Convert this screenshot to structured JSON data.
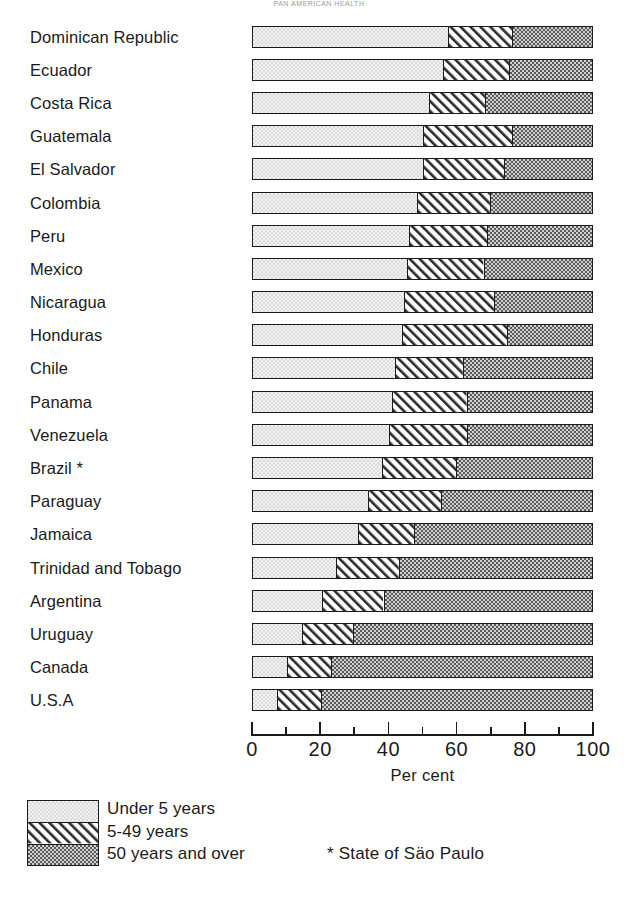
{
  "title_faint": "PAN AMERICAN HEALTH",
  "axis": {
    "label": "Per cent",
    "min": 0,
    "max": 100,
    "major_ticks": [
      0,
      20,
      40,
      60,
      80,
      100
    ],
    "minor_ticks": [
      10,
      30,
      50,
      70,
      90
    ],
    "tick_labels": [
      "0",
      "20",
      "40",
      "60",
      "80",
      "100"
    ]
  },
  "legend": {
    "items": [
      {
        "key": "under5",
        "label": "Under 5 years",
        "pattern": "stipple-light"
      },
      {
        "key": "5to49",
        "label": "5-49 years",
        "pattern": "diagonal-hatch"
      },
      {
        "key": "50plus",
        "label": "50 years and over",
        "pattern": "checker-dark"
      }
    ],
    "footnote": "* State of Säo Paulo"
  },
  "chart_data": {
    "type": "bar",
    "orientation": "horizontal",
    "stacked": true,
    "stack_total": 100,
    "title": "",
    "xlabel": "Per cent",
    "ylabel": "",
    "xlim": [
      0,
      100
    ],
    "grid": false,
    "legend_position": "bottom-left",
    "categories": [
      "Dominican Republic",
      "Ecuador",
      "Costa Rica",
      "Guatemala",
      "El Salvador",
      "Colombia",
      "Peru",
      "Mexico",
      "Nicaragua",
      "Honduras",
      "Chile",
      "Panama",
      "Venezuela",
      "Brazil *",
      "Paraguay",
      "Jamaica",
      "Trinidad and Tobago",
      "Argentina",
      "Uruguay",
      "Canada",
      "U.S.A"
    ],
    "series": [
      {
        "name": "Under 5 years",
        "values": [
          57.5,
          56.0,
          52.0,
          50.0,
          50.0,
          48.5,
          46.0,
          45.5,
          44.5,
          44.0,
          42.0,
          41.0,
          40.0,
          38.0,
          34.0,
          31.0,
          24.5,
          20.5,
          14.5,
          10.0,
          7.0
        ]
      },
      {
        "name": "5-49 years",
        "values": [
          19.0,
          19.5,
          16.5,
          26.5,
          24.0,
          21.5,
          23.0,
          22.5,
          26.5,
          31.0,
          20.0,
          22.0,
          23.0,
          22.0,
          21.5,
          16.5,
          18.5,
          18.0,
          15.0,
          13.0,
          13.0
        ]
      },
      {
        "name": "50 years and over",
        "values": [
          23.5,
          24.5,
          31.5,
          23.5,
          26.0,
          30.0,
          31.0,
          32.0,
          29.0,
          25.0,
          38.0,
          37.0,
          37.0,
          40.0,
          44.5,
          52.5,
          57.0,
          61.5,
          70.5,
          77.0,
          80.0
        ]
      }
    ]
  }
}
